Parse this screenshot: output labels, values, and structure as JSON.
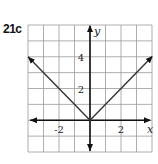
{
  "problem_label": "21c",
  "chart_data": {
    "type": "line",
    "title": "",
    "function": "y = |x|",
    "xlabel": "x",
    "ylabel": "y",
    "xlim": [
      -4,
      4
    ],
    "ylim": [
      -2,
      6
    ],
    "grid": true,
    "grid_step": 1,
    "x_ticks": [
      {
        "value": -2,
        "label": "-2"
      },
      {
        "value": 2,
        "label": "2"
      }
    ],
    "y_ticks": [
      {
        "value": 2,
        "label": "2"
      },
      {
        "value": 4,
        "label": "4"
      }
    ],
    "series": [
      {
        "name": "y=|x|",
        "x": [
          -4,
          0,
          4
        ],
        "y": [
          4,
          0,
          4
        ],
        "arrows": "both-ends"
      }
    ],
    "colors": {
      "grid": "#9a9a9a",
      "axis": "#111111",
      "line": "#333333"
    }
  }
}
